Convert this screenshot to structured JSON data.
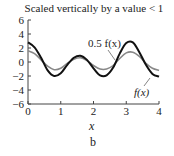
{
  "chart_data": {
    "type": "line",
    "title": "Scaled vertically by a value < 1",
    "xlabel": "x",
    "ylabel": "",
    "subfigure_label": "b",
    "xlim": [
      0,
      4
    ],
    "ylim": [
      -6,
      6
    ],
    "x_ticks": [
      0,
      1,
      2,
      3,
      4
    ],
    "y_ticks": [
      6,
      4,
      2,
      0,
      -2,
      -4,
      -6
    ],
    "grid": false,
    "legend": "inline annotations",
    "annotations": [
      "0.5 f(x)",
      "f(x)"
    ],
    "x": [
      0,
      0.2,
      0.4,
      0.6,
      0.8,
      1.0,
      1.2,
      1.4,
      1.6,
      1.8,
      2.0,
      2.2,
      2.4,
      2.6,
      2.8,
      3.0,
      3.2,
      3.4,
      3.6,
      3.8,
      4.0
    ],
    "series": [
      {
        "name": "f(x)",
        "color": "#111111",
        "values": [
          2.8,
          2.1,
          0.6,
          -1.2,
          -2.0,
          -1.6,
          -0.4,
          0.6,
          0.9,
          0.3,
          -0.9,
          -1.9,
          -1.9,
          -0.8,
          1.2,
          2.7,
          2.8,
          1.4,
          -0.4,
          -1.7,
          -2.1
        ]
      },
      {
        "name": "0.5 f(x)",
        "color": "#888888",
        "values": [
          1.6,
          1.2,
          0.3,
          -0.6,
          -1.1,
          -0.9,
          -0.2,
          0.4,
          0.6,
          0.2,
          -0.5,
          -1.0,
          -1.0,
          -0.5,
          0.5,
          1.3,
          1.4,
          0.8,
          -0.2,
          -0.9,
          -1.2
        ]
      }
    ]
  },
  "labels": {
    "title": "Scaled vertically by a value < 1",
    "xlabel": "x",
    "sub": "b",
    "series_a": "0.5 f(x)",
    "series_b": "f(x)"
  }
}
